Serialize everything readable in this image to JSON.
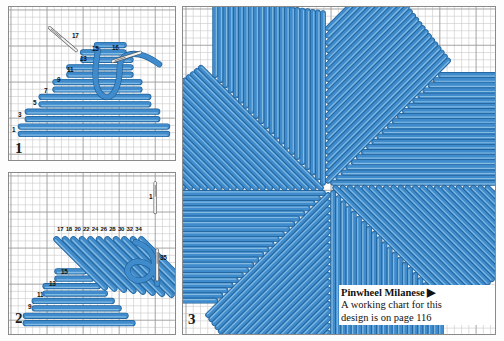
{
  "page": {
    "background": "#ffffff",
    "stitch_color": "#3f8bcc",
    "stitch_highlight": "#8fc4e8",
    "stitch_outline": "#1f5f96",
    "grid_line": "#c9c9c9",
    "grid_major": "#9a9a9a",
    "panel_border": "#8a8a8a",
    "needle_body": "#f2f2f2",
    "needle_outline": "#555555"
  },
  "panels": [
    {
      "id": "panel-1",
      "number": "1",
      "labels": [
        {
          "text": "1",
          "x": 3,
          "y": 120
        },
        {
          "text": "3",
          "x": 9,
          "y": 105
        },
        {
          "text": "5",
          "x": 24,
          "y": 93
        },
        {
          "text": "7",
          "x": 35,
          "y": 81
        },
        {
          "text": "9",
          "x": 48,
          "y": 70
        },
        {
          "text": "11",
          "x": 58,
          "y": 60
        },
        {
          "text": "13",
          "x": 71,
          "y": 49
        },
        {
          "text": "15",
          "x": 83,
          "y": 39
        },
        {
          "text": "16",
          "x": 103,
          "y": 38
        },
        {
          "text": "17",
          "x": 63,
          "y": 26
        }
      ]
    },
    {
      "id": "panel-2",
      "number": "2",
      "labels": [
        {
          "text": "9",
          "x": 19,
          "y": 131
        },
        {
          "text": "11",
          "x": 28,
          "y": 119
        },
        {
          "text": "13",
          "x": 40,
          "y": 108
        },
        {
          "text": "15",
          "x": 52,
          "y": 96
        },
        {
          "text": "1",
          "x": 140,
          "y": 21
        },
        {
          "text": "35",
          "x": 151,
          "y": 82
        }
      ],
      "top_row_numbers": [
        "17",
        "18",
        "20",
        "22",
        "24",
        "26",
        "28",
        "30",
        "32",
        "34"
      ]
    },
    {
      "id": "panel-3",
      "number": "3"
    }
  ],
  "caption": {
    "title": "Pinwheel Milanese",
    "arrow": "▶",
    "line1": "A working chart for this",
    "line2": "design is on page 116"
  },
  "chart_data": {
    "type": "diagram",
    "title": "Pinwheel Milanese",
    "subtitle": "A working chart for this design is on page 116",
    "panel_1": {
      "label": "1",
      "stitch_sequence": [
        1,
        3,
        5,
        7,
        9,
        11,
        13,
        15,
        16,
        17
      ],
      "note": "Horizontal graduated straight stitches worked in a stepped triangle, needle shown entering at 16 and 17"
    },
    "panel_2": {
      "label": "2",
      "left_sequence": [
        9,
        11,
        13,
        15
      ],
      "top_sequence": [
        17,
        18,
        20,
        22,
        24,
        26,
        28,
        30,
        32,
        34
      ],
      "end_point": 35,
      "start_point": 1,
      "note": "Diagonal stitches worked over the horizontal block, forming the second half of the triangular unit"
    },
    "panel_3": {
      "label": "3",
      "sections": 8,
      "note": "Completed pinwheel: eight triangular stitch sections rotating around a common centre"
    },
    "grid": {
      "cell_px": 7.3,
      "major_every": 5
    }
  }
}
